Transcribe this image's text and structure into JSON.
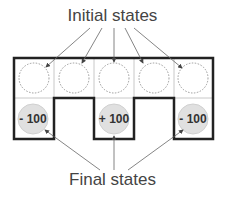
{
  "diagram": {
    "top_label": "Initial states",
    "bottom_label": "Final states",
    "grid": {
      "columns": 5,
      "rows": 2,
      "top_row": [
        {
          "state": "initial",
          "value": ""
        },
        {
          "state": "initial",
          "value": ""
        },
        {
          "state": "initial",
          "value": ""
        },
        {
          "state": "initial",
          "value": ""
        },
        {
          "state": "initial",
          "value": ""
        }
      ],
      "bottom_row": [
        {
          "state": "final",
          "value": "- 100"
        },
        {
          "state": "wall",
          "value": ""
        },
        {
          "state": "final",
          "value": "+ 100"
        },
        {
          "state": "wall",
          "value": ""
        },
        {
          "state": "final",
          "value": "- 100"
        }
      ]
    },
    "colors": {
      "outline": "#222222",
      "grid_line": "#c8c8c8",
      "final_state_fill": "#e0e0e0",
      "arrow": "#666666",
      "text": "#444444"
    }
  }
}
